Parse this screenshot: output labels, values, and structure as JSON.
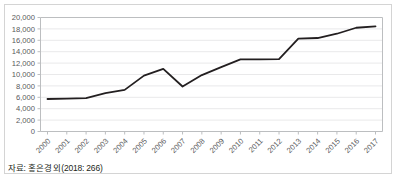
{
  "caption": "자료: 홍은경 외(2018: 266)",
  "colors": {
    "line": "#231f20",
    "grid": "#e9e9ea",
    "axis": "#bcbec0",
    "frame": "#d4d4d4",
    "text": "#58595b",
    "caption_text": "#231f20",
    "background": "#ffffff"
  },
  "chart_data": {
    "type": "line",
    "title": "",
    "subtitle": "",
    "xlabel": "",
    "ylabel": "",
    "x": [
      "2000",
      "2001",
      "2002",
      "2003",
      "2004",
      "2005",
      "2006",
      "2007",
      "2008",
      "2009",
      "2010",
      "2011",
      "2012",
      "2013",
      "2014",
      "2015",
      "2016",
      "2017"
    ],
    "categories": [
      "2000",
      "2001",
      "2002",
      "2003",
      "2004",
      "2005",
      "2006",
      "2007",
      "2008",
      "2009",
      "2010",
      "2011",
      "2012",
      "2013",
      "2014",
      "2015",
      "2016",
      "2017"
    ],
    "values": [
      5700,
      5750,
      5850,
      6750,
      7300,
      9800,
      11000,
      7900,
      9900,
      11300,
      12650,
      12650,
      12700,
      16300,
      16400,
      17150,
      18200,
      18450
    ],
    "series": [
      {
        "name": "",
        "values": [
          5700,
          5750,
          5850,
          6750,
          7300,
          9800,
          11000,
          7900,
          9900,
          11300,
          12650,
          12650,
          12700,
          16300,
          16400,
          17150,
          18200,
          18450
        ]
      }
    ],
    "ylim": [
      0,
      20000
    ],
    "ytick_values": [
      0,
      2000,
      4000,
      6000,
      8000,
      10000,
      12000,
      14000,
      16000,
      18000,
      20000
    ],
    "ytick_labels": [
      "0",
      "2,000",
      "4,000",
      "6,000",
      "8,000",
      "10,000",
      "12,000",
      "14,000",
      "16,000",
      "18,000",
      "20,000"
    ],
    "grid": true,
    "grid_axis": "y",
    "legend": false,
    "legend_position": "none",
    "xtick_rotation": -45,
    "markers": false,
    "line_width": 1.8
  }
}
